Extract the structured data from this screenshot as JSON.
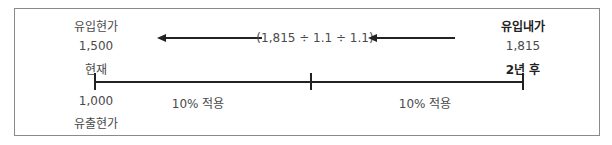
{
  "diagram": {
    "left": {
      "inflow_label": "유입현가",
      "inflow_value": "1,500",
      "time_label": "현재",
      "outflow_value": "1,000",
      "outflow_label": "유출현가"
    },
    "right": {
      "inflow_label": "유입내가",
      "inflow_value": "1,815",
      "time_label": "2년 후"
    },
    "formula": "(1,815 ÷ 1.1 ÷ 1.1)",
    "segments": [
      {
        "label": "10% 적용"
      },
      {
        "label": "10% 적용"
      }
    ],
    "colors": {
      "line": "#222222",
      "text": "#4a4a4a",
      "border": "#8a8a8a"
    }
  }
}
